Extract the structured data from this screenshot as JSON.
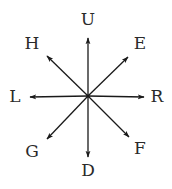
{
  "diagram": {
    "type": "direction-compass",
    "center": {
      "x": 88,
      "y": 96
    },
    "line_color": "#1a1a1a",
    "label_color": "#2a2a2a",
    "directions": [
      {
        "id": "up",
        "label": "U",
        "tip": {
          "x": 88,
          "y": 38
        },
        "label_pos": {
          "x": 88,
          "y": 20
        }
      },
      {
        "id": "up-right",
        "label": "E",
        "tip": {
          "x": 128,
          "y": 57
        },
        "label_pos": {
          "x": 140,
          "y": 44
        }
      },
      {
        "id": "right",
        "label": "R",
        "tip": {
          "x": 144,
          "y": 97
        },
        "label_pos": {
          "x": 157,
          "y": 97
        }
      },
      {
        "id": "down-right",
        "label": "F",
        "tip": {
          "x": 129,
          "y": 137
        },
        "label_pos": {
          "x": 140,
          "y": 149
        }
      },
      {
        "id": "down",
        "label": "D",
        "tip": {
          "x": 88,
          "y": 157
        },
        "label_pos": {
          "x": 88,
          "y": 171
        }
      },
      {
        "id": "down-left",
        "label": "G",
        "tip": {
          "x": 47,
          "y": 139
        },
        "label_pos": {
          "x": 32,
          "y": 152
        }
      },
      {
        "id": "left",
        "label": "L",
        "tip": {
          "x": 30,
          "y": 97
        },
        "label_pos": {
          "x": 15,
          "y": 97
        }
      },
      {
        "id": "up-left",
        "label": "H",
        "tip": {
          "x": 47,
          "y": 56
        },
        "label_pos": {
          "x": 32,
          "y": 44
        }
      }
    ]
  },
  "labels": {
    "up": "U",
    "up_right": "E",
    "right": "R",
    "down_right": "F",
    "down": "D",
    "down_left": "G",
    "left": "L",
    "up_left": "H"
  }
}
